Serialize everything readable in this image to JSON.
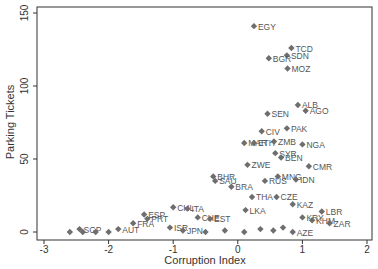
{
  "chart_data": {
    "type": "scatter",
    "title": "",
    "xlabel": "Corruption Index",
    "ylabel": "Parking Tickets",
    "xlim": [
      -3,
      2
    ],
    "ylim": [
      0,
      150
    ],
    "xticks": [
      "-3",
      "-2",
      "-1",
      "0",
      "1",
      "2"
    ],
    "yticks": [
      "0",
      "50",
      "100",
      "150"
    ],
    "grid": false,
    "legend": null,
    "marker": "diamond",
    "marker_color": "#6e6e6e",
    "label_color": "#555555",
    "points": [
      {
        "label": "EGY",
        "x": 0.25,
        "y": 141
      },
      {
        "label": "TCD",
        "x": 0.83,
        "y": 126
      },
      {
        "label": "SDN",
        "x": 0.76,
        "y": 121
      },
      {
        "label": "BGR",
        "x": 0.48,
        "y": 119
      },
      {
        "label": "MOZ",
        "x": 0.77,
        "y": 112
      },
      {
        "label": "ALB",
        "x": 0.93,
        "y": 87
      },
      {
        "label": "AGO",
        "x": 1.05,
        "y": 83
      },
      {
        "label": "SEN",
        "x": 0.46,
        "y": 81
      },
      {
        "label": "PAK",
        "x": 0.76,
        "y": 71
      },
      {
        "label": "CIV",
        "x": 0.37,
        "y": 69
      },
      {
        "label": "MAR",
        "x": 0.1,
        "y": 61
      },
      {
        "label": "ETH",
        "x": 0.25,
        "y": 61
      },
      {
        "label": "ZMB",
        "x": 0.56,
        "y": 62
      },
      {
        "label": "NGA",
        "x": 1.0,
        "y": 60
      },
      {
        "label": "SYR",
        "x": 0.58,
        "y": 54
      },
      {
        "label": "BEN",
        "x": 0.67,
        "y": 51
      },
      {
        "label": "ZWE",
        "x": 0.15,
        "y": 46
      },
      {
        "label": "CMR",
        "x": 1.1,
        "y": 45
      },
      {
        "label": "BHR",
        "x": -0.38,
        "y": 38
      },
      {
        "label": "SAU",
        "x": -0.35,
        "y": 35
      },
      {
        "label": "MNG",
        "x": 0.62,
        "y": 38
      },
      {
        "label": "IDN",
        "x": 0.9,
        "y": 36
      },
      {
        "label": "BRA",
        "x": -0.1,
        "y": 31
      },
      {
        "label": "RUS",
        "x": 0.42,
        "y": 35
      },
      {
        "label": "THA",
        "x": 0.22,
        "y": 24
      },
      {
        "label": "CZE",
        "x": 0.6,
        "y": 24
      },
      {
        "label": "KAZ",
        "x": 0.85,
        "y": 19
      },
      {
        "label": "LKA",
        "x": 0.12,
        "y": 15
      },
      {
        "label": "CHL",
        "x": -1.0,
        "y": 17
      },
      {
        "label": "ITA",
        "x": -0.78,
        "y": 16
      },
      {
        "label": "ESP",
        "x": -1.45,
        "y": 12
      },
      {
        "label": "PRT",
        "x": -1.4,
        "y": 9
      },
      {
        "label": "FRA",
        "x": -1.62,
        "y": 6
      },
      {
        "label": "CHE",
        "x": -0.62,
        "y": 10
      },
      {
        "label": "EST",
        "x": -0.43,
        "y": 9
      },
      {
        "label": "KRY",
        "x": 1.0,
        "y": 10
      },
      {
        "label": "LBR",
        "x": 1.3,
        "y": 14
      },
      {
        "label": "KHM",
        "x": 1.15,
        "y": 8
      },
      {
        "label": "ZAR",
        "x": 1.42,
        "y": 6
      },
      {
        "label": "SGP",
        "x": -2.45,
        "y": 2
      },
      {
        "label": "AUT",
        "x": -1.85,
        "y": 2
      },
      {
        "label": "ISR",
        "x": -1.05,
        "y": 3
      },
      {
        "label": "JPN",
        "x": -0.85,
        "y": 1
      },
      {
        "label": "AZE",
        "x": 0.85,
        "y": 0
      },
      {
        "label": "",
        "x": -2.6,
        "y": 0
      },
      {
        "label": "",
        "x": -2.4,
        "y": 0
      },
      {
        "label": "",
        "x": -2.2,
        "y": 0
      },
      {
        "label": "",
        "x": -2.0,
        "y": 0
      },
      {
        "label": "",
        "x": -0.5,
        "y": 0
      },
      {
        "label": "",
        "x": -0.2,
        "y": 1
      },
      {
        "label": "",
        "x": 0.1,
        "y": 0
      },
      {
        "label": "",
        "x": 0.35,
        "y": 2
      },
      {
        "label": "",
        "x": 0.55,
        "y": 1
      },
      {
        "label": "",
        "x": 0.7,
        "y": 3
      }
    ]
  }
}
